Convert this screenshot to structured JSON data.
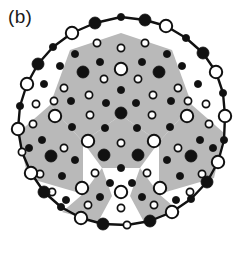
{
  "figure": {
    "panel_label": "(b)",
    "caption_text": "",
    "type": "atomic-cluster-projection",
    "symmetry": "5-fold",
    "width": 242,
    "height": 259
  },
  "colors": {
    "background": "#ffffff",
    "shading_gray": "#b9b9b9",
    "outline_black": "#111111",
    "atom_fill_black": "#111111",
    "atom_fill_white": "#ffffff",
    "stroke_white_atom": "#111111"
  },
  "legend": {
    "large_white_circle": "large-white-atom",
    "large_black_circle": "large-black-atom",
    "small_white_circle": "small-white-atom",
    "small_black_circle": "small-black-atom",
    "gray_region": "shaded-tile",
    "polygon_edge": "cluster-boundary-edge"
  },
  "geometry": {
    "center": [
      121,
      129
    ],
    "outer_radius": 112,
    "decagon_rotation_deg": 0
  },
  "shaded_regions": [
    {
      "name": "tile-upper-left",
      "points": "121,33 70,50 50,105 83,142 121,115"
    },
    {
      "name": "tile-upper-right",
      "points": "121,33 172,50 192,105 159,142 121,115"
    },
    {
      "name": "tile-left",
      "points": "50,105 18,133 28,178 83,194 83,142"
    },
    {
      "name": "tile-right",
      "points": "192,105 224,133 214,178 159,194 159,142"
    },
    {
      "name": "tile-bottom-wedge",
      "points": "83,142 121,115 159,142 140,168 102,168"
    },
    {
      "name": "tile-lower-left-spur",
      "points": "83,194 62,212 98,222 112,196 102,168"
    },
    {
      "name": "tile-lower-right-spur",
      "points": "159,194 180,212 144,222 130,196 140,168"
    }
  ],
  "boundary_vertices": [
    {
      "x": 121,
      "y": 17,
      "kind": "small-black"
    },
    {
      "x": 145,
      "y": 20,
      "kind": "large-black"
    },
    {
      "x": 166,
      "y": 26,
      "kind": "large-white"
    },
    {
      "x": 186,
      "y": 38,
      "kind": "small-black"
    },
    {
      "x": 203,
      "y": 53,
      "kind": "large-black"
    },
    {
      "x": 216,
      "y": 72,
      "kind": "large-white"
    },
    {
      "x": 223,
      "y": 93,
      "kind": "small-black"
    },
    {
      "x": 225,
      "y": 116,
      "kind": "large-white"
    },
    {
      "x": 224,
      "y": 140,
      "kind": "small-black"
    },
    {
      "x": 218,
      "y": 162,
      "kind": "large-white"
    },
    {
      "x": 207,
      "y": 182,
      "kind": "large-black"
    },
    {
      "x": 191,
      "y": 199,
      "kind": "small-black"
    },
    {
      "x": 172,
      "y": 212,
      "kind": "large-white"
    },
    {
      "x": 150,
      "y": 221,
      "kind": "large-black"
    },
    {
      "x": 127,
      "y": 225,
      "kind": "small-white"
    },
    {
      "x": 103,
      "y": 224,
      "kind": "large-black"
    },
    {
      "x": 81,
      "y": 218,
      "kind": "large-white"
    },
    {
      "x": 61,
      "y": 207,
      "kind": "small-black"
    },
    {
      "x": 44,
      "y": 192,
      "kind": "large-black"
    },
    {
      "x": 31,
      "y": 173,
      "kind": "large-white"
    },
    {
      "x": 22,
      "y": 152,
      "kind": "small-white"
    },
    {
      "x": 18,
      "y": 129,
      "kind": "large-white"
    },
    {
      "x": 20,
      "y": 106,
      "kind": "small-black"
    },
    {
      "x": 27,
      "y": 84,
      "kind": "large-white"
    },
    {
      "x": 38,
      "y": 64,
      "kind": "large-black"
    },
    {
      "x": 53,
      "y": 47,
      "kind": "small-black"
    },
    {
      "x": 72,
      "y": 33,
      "kind": "large-white"
    },
    {
      "x": 95,
      "y": 23,
      "kind": "large-black"
    }
  ],
  "interior_atoms": [
    {
      "x": 121,
      "y": 48,
      "kind": "small-white"
    },
    {
      "x": 97,
      "y": 43,
      "kind": "small-white"
    },
    {
      "x": 145,
      "y": 43,
      "kind": "small-white"
    },
    {
      "x": 75,
      "y": 54,
      "kind": "small-black"
    },
    {
      "x": 167,
      "y": 54,
      "kind": "small-black"
    },
    {
      "x": 121,
      "y": 69,
      "kind": "large-white"
    },
    {
      "x": 100,
      "y": 62,
      "kind": "small-black"
    },
    {
      "x": 142,
      "y": 62,
      "kind": "small-black"
    },
    {
      "x": 60,
      "y": 66,
      "kind": "small-black"
    },
    {
      "x": 182,
      "y": 66,
      "kind": "small-black"
    },
    {
      "x": 44,
      "y": 84,
      "kind": "small-black"
    },
    {
      "x": 198,
      "y": 84,
      "kind": "small-black"
    },
    {
      "x": 83,
      "y": 72,
      "kind": "large-black"
    },
    {
      "x": 159,
      "y": 72,
      "kind": "large-black"
    },
    {
      "x": 104,
      "y": 79,
      "kind": "small-white"
    },
    {
      "x": 138,
      "y": 79,
      "kind": "small-white"
    },
    {
      "x": 64,
      "y": 88,
      "kind": "small-white"
    },
    {
      "x": 178,
      "y": 88,
      "kind": "small-white"
    },
    {
      "x": 121,
      "y": 90,
      "kind": "small-black"
    },
    {
      "x": 89,
      "y": 95,
      "kind": "small-white"
    },
    {
      "x": 153,
      "y": 95,
      "kind": "small-white"
    },
    {
      "x": 36,
      "y": 104,
      "kind": "small-white"
    },
    {
      "x": 206,
      "y": 104,
      "kind": "small-white"
    },
    {
      "x": 54,
      "y": 101,
      "kind": "small-white"
    },
    {
      "x": 188,
      "y": 101,
      "kind": "small-white"
    },
    {
      "x": 71,
      "y": 101,
      "kind": "small-black"
    },
    {
      "x": 171,
      "y": 101,
      "kind": "small-black"
    },
    {
      "x": 106,
      "y": 103,
      "kind": "small-black"
    },
    {
      "x": 136,
      "y": 103,
      "kind": "small-black"
    },
    {
      "x": 121,
      "y": 113,
      "kind": "large-black"
    },
    {
      "x": 55,
      "y": 116,
      "kind": "large-white"
    },
    {
      "x": 187,
      "y": 116,
      "kind": "large-white"
    },
    {
      "x": 90,
      "y": 115,
      "kind": "small-white"
    },
    {
      "x": 152,
      "y": 115,
      "kind": "small-white"
    },
    {
      "x": 33,
      "y": 124,
      "kind": "small-white"
    },
    {
      "x": 209,
      "y": 124,
      "kind": "small-white"
    },
    {
      "x": 72,
      "y": 127,
      "kind": "small-black"
    },
    {
      "x": 170,
      "y": 127,
      "kind": "small-black"
    },
    {
      "x": 105,
      "y": 128,
      "kind": "small-black"
    },
    {
      "x": 137,
      "y": 128,
      "kind": "small-black"
    },
    {
      "x": 42,
      "y": 140,
      "kind": "small-black"
    },
    {
      "x": 200,
      "y": 140,
      "kind": "small-black"
    },
    {
      "x": 88,
      "y": 141,
      "kind": "large-white"
    },
    {
      "x": 154,
      "y": 141,
      "kind": "large-white"
    },
    {
      "x": 121,
      "y": 143,
      "kind": "small-white"
    },
    {
      "x": 64,
      "y": 148,
      "kind": "small-white"
    },
    {
      "x": 178,
      "y": 148,
      "kind": "small-white"
    },
    {
      "x": 29,
      "y": 148,
      "kind": "small-black"
    },
    {
      "x": 213,
      "y": 148,
      "kind": "small-black"
    },
    {
      "x": 104,
      "y": 155,
      "kind": "large-black"
    },
    {
      "x": 138,
      "y": 155,
      "kind": "large-black"
    },
    {
      "x": 51,
      "y": 156,
      "kind": "large-black"
    },
    {
      "x": 191,
      "y": 156,
      "kind": "large-black"
    },
    {
      "x": 75,
      "y": 160,
      "kind": "small-black"
    },
    {
      "x": 167,
      "y": 160,
      "kind": "small-black"
    },
    {
      "x": 121,
      "y": 168,
      "kind": "small-black"
    },
    {
      "x": 95,
      "y": 173,
      "kind": "small-white"
    },
    {
      "x": 147,
      "y": 173,
      "kind": "small-white"
    },
    {
      "x": 40,
      "y": 174,
      "kind": "small-white"
    },
    {
      "x": 202,
      "y": 174,
      "kind": "small-white"
    },
    {
      "x": 62,
      "y": 176,
      "kind": "small-black"
    },
    {
      "x": 180,
      "y": 176,
      "kind": "small-black"
    },
    {
      "x": 110,
      "y": 183,
      "kind": "small-black"
    },
    {
      "x": 132,
      "y": 183,
      "kind": "small-black"
    },
    {
      "x": 82,
      "y": 188,
      "kind": "large-white"
    },
    {
      "x": 160,
      "y": 188,
      "kind": "large-white"
    },
    {
      "x": 52,
      "y": 192,
      "kind": "small-white"
    },
    {
      "x": 190,
      "y": 192,
      "kind": "small-white"
    },
    {
      "x": 121,
      "y": 192,
      "kind": "large-white"
    },
    {
      "x": 100,
      "y": 197,
      "kind": "small-black"
    },
    {
      "x": 142,
      "y": 197,
      "kind": "small-black"
    },
    {
      "x": 66,
      "y": 200,
      "kind": "small-black"
    },
    {
      "x": 176,
      "y": 200,
      "kind": "small-black"
    },
    {
      "x": 88,
      "y": 205,
      "kind": "small-white"
    },
    {
      "x": 154,
      "y": 205,
      "kind": "small-white"
    },
    {
      "x": 121,
      "y": 208,
      "kind": "small-white"
    }
  ],
  "atom_styles": {
    "large-white": {
      "r": 6.2,
      "fill": "#ffffff",
      "stroke": "#111111",
      "stroke_width": 2.0
    },
    "large-black": {
      "r": 6.0,
      "fill": "#111111",
      "stroke": "#111111",
      "stroke_width": 0.8
    },
    "small-white": {
      "r": 3.6,
      "fill": "#ffffff",
      "stroke": "#111111",
      "stroke_width": 1.7
    },
    "small-black": {
      "r": 3.6,
      "fill": "#111111",
      "stroke": "#111111",
      "stroke_width": 0.8
    }
  }
}
